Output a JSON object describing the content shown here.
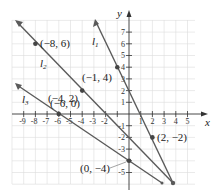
{
  "figure": {
    "axis_labels": {
      "x": "x",
      "y": "y"
    },
    "x_ticks": [
      "-9",
      "-8",
      "-7",
      "-6",
      "-5",
      "-4",
      "-3",
      "-2",
      "1",
      "2",
      "3",
      "4",
      "5"
    ],
    "y_ticks": [
      "7",
      "6",
      "5",
      "4",
      "3",
      "2",
      "1",
      "-1",
      "-2",
      "-3",
      "-5"
    ],
    "lines": [
      {
        "name": "l1",
        "label": "l",
        "sub": "1",
        "equation": "y = -2x + 2"
      },
      {
        "name": "l2",
        "label": "l",
        "sub": "2",
        "equation": "y = -x - 2"
      },
      {
        "name": "l3",
        "label": "l",
        "sub": "3",
        "equation": "y = -2/3 x - 4"
      }
    ],
    "points": [
      {
        "label": "(−8, 6)",
        "x": -8,
        "y": 6
      },
      {
        "label": "(−1, 4)",
        "x": -1,
        "y": 4
      },
      {
        "label": "(−4, 2)",
        "x": -4,
        "y": 2
      },
      {
        "label": "(−6, 0)",
        "x": -6,
        "y": 0
      },
      {
        "label": "(2, −2)",
        "x": 2,
        "y": -2
      },
      {
        "label": "(0, −4)",
        "x": 0,
        "y": -4
      }
    ],
    "colors": {
      "line": "#5a5a5a",
      "grid": "#d9d9d9",
      "axis": "#333333"
    }
  }
}
